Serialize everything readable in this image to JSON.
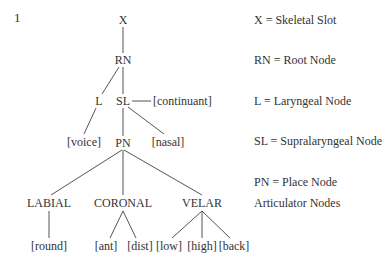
{
  "example_number": "1",
  "tree": {
    "x": "X",
    "rn": "RN",
    "l": "L",
    "sl": "SL",
    "continuant": "[continuant]",
    "voice": "[voice]",
    "nasal": "[nasal]",
    "pn": "PN",
    "labial": "LABIAL",
    "coronal": "CORONAL",
    "velar": "VELAR",
    "round": "[round]",
    "ant": "[ant]",
    "dist": "[dist]",
    "low": "[low]",
    "high": "[high]",
    "back": "[back]"
  },
  "legend": {
    "x": "X = Skeletal Slot",
    "rn": "RN = Root Node",
    "l": "L = Laryngeal Node",
    "sl": "SL = Supralaryngeal Node",
    "pn": "PN = Place Node",
    "articulator": "Articulator Nodes"
  }
}
